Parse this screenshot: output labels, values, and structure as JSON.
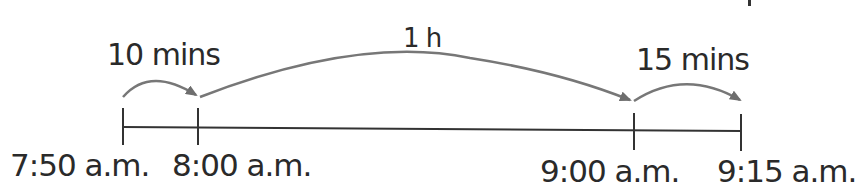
{
  "diagram": {
    "type": "time-number-line",
    "ticks": [
      {
        "label": "7:50 a.m.",
        "x": 122
      },
      {
        "label": "8:00 a.m.",
        "x": 198
      },
      {
        "label": "9:00 a.m.",
        "x": 634
      },
      {
        "label": "9:15 a.m.",
        "x": 741
      }
    ],
    "jumps": [
      {
        "label": "10 mins",
        "from": "7:50 a.m.",
        "to": "8:00 a.m."
      },
      {
        "label": "1 h",
        "from": "8:00 a.m.",
        "to": "9:00 a.m."
      },
      {
        "label": "15 mins",
        "from": "9:00 a.m.",
        "to": "9:15 a.m."
      }
    ],
    "colors": {
      "line": "#333333",
      "arrow": "#777777",
      "text": "#2a2a2a"
    }
  }
}
